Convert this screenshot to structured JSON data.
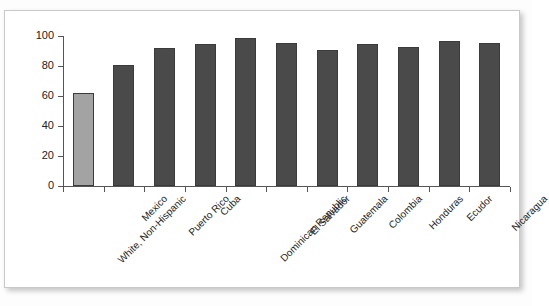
{
  "chart_data": {
    "type": "bar",
    "title": "",
    "subtitle": "",
    "xlabel": "",
    "ylabel": "",
    "categories": [
      "White, Non-Hispanic",
      "Mexico",
      "Puerto Rico",
      "Cuba",
      "Dominican Republic",
      "El Salvador",
      "Guatemala",
      "Colombia",
      "Honduras",
      "Ecudor",
      "Nicaragua"
    ],
    "values": [
      62,
      81,
      92,
      94.5,
      98.5,
      95.5,
      91,
      95,
      92.5,
      96.5,
      95.5
    ],
    "ylim": [
      0,
      100
    ],
    "yticks": [
      0,
      20,
      40,
      60,
      80,
      100
    ],
    "ytick_labels": [
      "0",
      "20",
      "40",
      "60",
      "80",
      "100"
    ],
    "grid": false,
    "legend": false,
    "bar_colors": [
      "#a3a3a3",
      "#4a4a4a",
      "#4a4a4a",
      "#4a4a4a",
      "#4a4a4a",
      "#4a4a4a",
      "#4a4a4a",
      "#4a4a4a",
      "#4a4a4a",
      "#4a4a4a",
      "#4a4a4a"
    ],
    "bar_edge_color": "#3b3b3b",
    "axis_color": "#555555",
    "plot_background": "#ffffff"
  },
  "frame": {
    "border_color": "#c9c9c9",
    "background": "#ffffff"
  }
}
